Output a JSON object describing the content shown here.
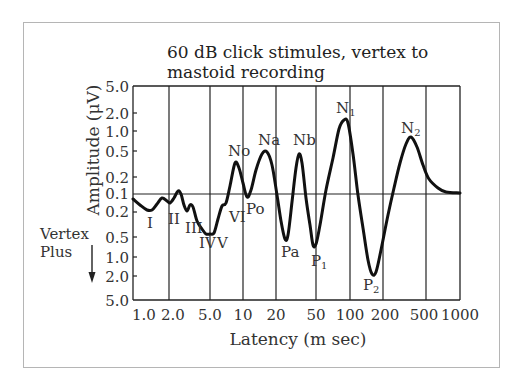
{
  "chart_data": {
    "type": "line",
    "title": "60   dB click stimules, vertex to mastoid recording",
    "title_lines": [
      "60   dB click stimules, vertex to",
      "mastoid recording"
    ],
    "xlabel": "Latency (m sec)",
    "ylabel": "Amplitude (μV)",
    "side_note": [
      "Vertex",
      "Plus"
    ],
    "side_note_arrow": "down-arrow",
    "x_scale": "log",
    "xlim": [
      1.0,
      1000
    ],
    "x_ticks": [
      "1.0",
      "2.0",
      "5.0",
      "10",
      "20",
      "50",
      "100",
      "200",
      "500",
      "1000"
    ],
    "x_tick_values": [
      1,
      2,
      5,
      10,
      20,
      50,
      100,
      200,
      500,
      1000
    ],
    "y_scale": "log-bipolar (negative up, vertex-positive down)",
    "y_ticks": [
      "5.0",
      "2.0",
      "1.0",
      "0.5",
      "0.2",
      "0.1",
      "0.2",
      "0.5",
      "1.0",
      "2.0",
      "5.0"
    ],
    "y_tick_signed_values": [
      -5.0,
      -2.0,
      -1.0,
      -0.5,
      -0.2,
      0.1,
      0.2,
      0.5,
      1.0,
      2.0,
      5.0
    ],
    "grid": {
      "vertical_at": [
        2,
        5,
        10,
        20,
        50,
        100,
        200,
        500
      ],
      "horizontal_baseline": 0.1
    },
    "peaks": [
      {
        "label": "I",
        "latency_ms": 1.5,
        "amplitude_uV": 0.2,
        "polarity": "positive"
      },
      {
        "label": "II",
        "latency_ms": 2.1,
        "amplitude_uV": 0.17,
        "polarity": "positive"
      },
      {
        "label": "III",
        "latency_ms": 3.1,
        "amplitude_uV": 0.25,
        "polarity": "positive"
      },
      {
        "label": "IV",
        "latency_ms": 4.7,
        "amplitude_uV": 0.38,
        "polarity": "positive"
      },
      {
        "label": "V",
        "latency_ms": 5.5,
        "amplitude_uV": 0.4,
        "polarity": "positive"
      },
      {
        "label": "VI",
        "latency_ms": 7.0,
        "amplitude_uV": 0.15,
        "polarity": "positive"
      },
      {
        "label": "No",
        "latency_ms": 9.0,
        "amplitude_uV": 0.35,
        "polarity": "negative"
      },
      {
        "label": "Po",
        "latency_ms": 12.0,
        "amplitude_uV": 0.1,
        "polarity": "positive"
      },
      {
        "label": "Na",
        "latency_ms": 17.0,
        "amplitude_uV": 0.5,
        "polarity": "negative"
      },
      {
        "label": "Pa",
        "latency_ms": 27.0,
        "amplitude_uV": 0.55,
        "polarity": "positive"
      },
      {
        "label": "Nb",
        "latency_ms": 38.0,
        "amplitude_uV": 0.5,
        "polarity": "negative"
      },
      {
        "label": "P1",
        "latency_ms": 50.0,
        "amplitude_uV": 0.75,
        "polarity": "positive"
      },
      {
        "label": "N1",
        "latency_ms": 90.0,
        "amplitude_uV": 1.6,
        "polarity": "negative"
      },
      {
        "label": "P2",
        "latency_ms": 170.0,
        "amplitude_uV": 2.0,
        "polarity": "positive"
      },
      {
        "label": "N2",
        "latency_ms": 330.0,
        "amplitude_uV": 0.8,
        "polarity": "negative"
      }
    ],
    "series": [
      {
        "name": "ABR/MLR/SVR waveform",
        "points_px": [
          [
            133,
            199
          ],
          [
            140,
            205
          ],
          [
            147,
            210
          ],
          [
            152,
            210
          ],
          [
            157,
            204
          ],
          [
            162,
            198
          ],
          [
            167,
            201
          ],
          [
            170,
            203
          ],
          [
            174,
            198
          ],
          [
            178,
            191
          ],
          [
            181,
            194
          ],
          [
            184,
            205
          ],
          [
            187,
            211
          ],
          [
            190,
            205
          ],
          [
            193,
            207
          ],
          [
            197,
            221
          ],
          [
            202,
            229
          ],
          [
            206,
            234
          ],
          [
            210,
            234
          ],
          [
            214,
            233
          ],
          [
            218,
            219
          ],
          [
            222,
            206
          ],
          [
            226,
            203
          ],
          [
            230,
            186
          ],
          [
            235,
            163
          ],
          [
            239,
            168
          ],
          [
            243,
            183
          ],
          [
            247,
            197
          ],
          [
            251,
            190
          ],
          [
            256,
            170
          ],
          [
            262,
            154
          ],
          [
            267,
            152
          ],
          [
            272,
            165
          ],
          [
            277,
            195
          ],
          [
            281,
            221
          ],
          [
            285,
            239
          ],
          [
            288,
            235
          ],
          [
            292,
            202
          ],
          [
            296,
            168
          ],
          [
            299,
            154
          ],
          [
            302,
            163
          ],
          [
            306,
            198
          ],
          [
            310,
            225
          ],
          [
            313,
            245
          ],
          [
            316,
            244
          ],
          [
            320,
            225
          ],
          [
            326,
            190
          ],
          [
            333,
            158
          ],
          [
            339,
            129
          ],
          [
            344,
            120
          ],
          [
            348,
            123
          ],
          [
            353,
            154
          ],
          [
            358,
            195
          ],
          [
            363,
            228
          ],
          [
            368,
            260
          ],
          [
            372,
            274
          ],
          [
            376,
            272
          ],
          [
            381,
            250
          ],
          [
            388,
            215
          ],
          [
            394,
            188
          ],
          [
            400,
            163
          ],
          [
            406,
            144
          ],
          [
            411,
            137
          ],
          [
            417,
            147
          ],
          [
            423,
            165
          ],
          [
            429,
            179
          ],
          [
            438,
            188
          ],
          [
            446,
            192
          ],
          [
            460,
            193
          ]
        ]
      }
    ]
  },
  "labels": {
    "peaks": [
      {
        "text": "I",
        "x": 147,
        "y": 228
      },
      {
        "text": "II",
        "x": 168,
        "y": 224
      },
      {
        "text": "III",
        "x": 185,
        "y": 233
      },
      {
        "text": "IV",
        "x": 199,
        "y": 248
      },
      {
        "text": "V",
        "x": 217,
        "y": 248
      },
      {
        "text": "VI",
        "x": 229,
        "y": 222
      },
      {
        "text": "No",
        "x": 228,
        "y": 156
      },
      {
        "text": "Po",
        "x": 246,
        "y": 214
      },
      {
        "text": "Na",
        "x": 258,
        "y": 145
      },
      {
        "text": "Pa",
        "x": 281,
        "y": 257
      },
      {
        "text": "Nb",
        "x": 293,
        "y": 145
      },
      {
        "text": "P",
        "x": 311,
        "y": 266,
        "sub": "1"
      },
      {
        "text": "N",
        "x": 336,
        "y": 113,
        "sub": "1"
      },
      {
        "text": "P",
        "x": 363,
        "y": 290,
        "sub": "2"
      },
      {
        "text": "N",
        "x": 401,
        "y": 133,
        "sub": "2"
      }
    ]
  }
}
